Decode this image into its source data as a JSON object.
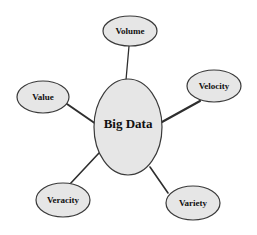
{
  "diagram": {
    "type": "mind-map",
    "center": {
      "label": "Big Data",
      "cx": 128,
      "cy": 127,
      "rx": 34,
      "ry": 48,
      "font_size": 13
    },
    "nodes": [
      {
        "id": "volume",
        "label": "Volume",
        "cx": 130,
        "cy": 31,
        "rx": 27,
        "ry": 15,
        "font_size": 9,
        "edge": {
          "x1": 129,
          "y1": 46,
          "x2": 126,
          "y2": 80,
          "width": 1.3
        }
      },
      {
        "id": "velocity",
        "label": "Velocity",
        "cx": 214,
        "cy": 86,
        "rx": 27,
        "ry": 16,
        "font_size": 9,
        "edge": {
          "x1": 200,
          "y1": 101,
          "x2": 162,
          "y2": 122,
          "width": 2.2
        }
      },
      {
        "id": "value",
        "label": "Value",
        "cx": 43,
        "cy": 97,
        "rx": 26,
        "ry": 16,
        "font_size": 9,
        "edge": {
          "x1": 67,
          "y1": 104,
          "x2": 96,
          "y2": 124,
          "width": 2.0
        }
      },
      {
        "id": "veracity",
        "label": "Veracity",
        "cx": 63,
        "cy": 200,
        "rx": 27,
        "ry": 17,
        "font_size": 9,
        "edge": {
          "x1": 70,
          "y1": 184,
          "x2": 99,
          "y2": 153,
          "width": 1.6
        }
      },
      {
        "id": "variety",
        "label": "Variety",
        "cx": 193,
        "cy": 203,
        "rx": 27,
        "ry": 17,
        "font_size": 9,
        "edge": {
          "x1": 168,
          "y1": 193,
          "x2": 150,
          "y2": 167,
          "width": 1.6
        }
      }
    ],
    "colors": {
      "node_fill": "#e6e6e6",
      "node_stroke": "#3a3a3a",
      "edge": "#2e2e2e",
      "text": "#111111",
      "background": "#ffffff"
    }
  }
}
